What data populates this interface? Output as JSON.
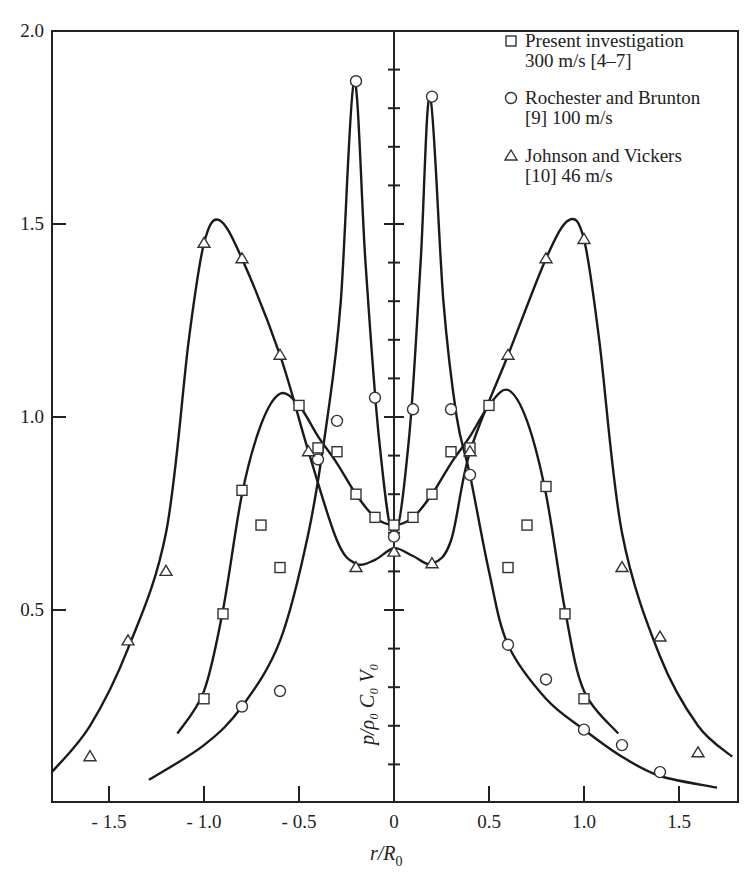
{
  "chart_data": {
    "type": "scatter",
    "title": "",
    "xlabel": "r/R0",
    "ylabel": "p/ρ0 C0 V0",
    "xlim": [
      -1.8,
      1.8
    ],
    "ylim": [
      0,
      2.0
    ],
    "grid": false,
    "legend_position": "upper right",
    "x_ticks": [
      -1.5,
      -1.0,
      -0.5,
      0,
      0.5,
      1.0,
      1.5
    ],
    "x_tick_labels": [
      "- 1.5",
      "- 1.0",
      "- 0.5",
      "0",
      "0.5",
      "1.0",
      "1.5"
    ],
    "y_ticks": [
      0.5,
      1.0,
      1.5,
      2.0
    ],
    "y_tick_labels": [
      "0.5",
      "1.0",
      "1.5",
      "2.0"
    ],
    "series": [
      {
        "name": "Present investigation 300 m/s [4-7]",
        "marker": "square",
        "points": [
          [
            -1.0,
            0.27
          ],
          [
            -0.9,
            0.49
          ],
          [
            -0.8,
            0.81
          ],
          [
            -0.7,
            0.72
          ],
          [
            -0.6,
            0.61
          ],
          [
            -0.5,
            1.03
          ],
          [
            -0.4,
            0.92
          ],
          [
            -0.3,
            0.91
          ],
          [
            -0.2,
            0.8
          ],
          [
            -0.1,
            0.74
          ],
          [
            0.0,
            0.72
          ],
          [
            0.1,
            0.74
          ],
          [
            0.2,
            0.8
          ],
          [
            0.3,
            0.91
          ],
          [
            0.4,
            0.92
          ],
          [
            0.5,
            1.03
          ],
          [
            0.6,
            0.61
          ],
          [
            0.7,
            0.72
          ],
          [
            0.8,
            0.82
          ],
          [
            0.9,
            0.49
          ],
          [
            1.0,
            0.27
          ]
        ],
        "curves": [
          [
            [
              -1.14,
              0.18
            ],
            [
              -1.0,
              0.29
            ],
            [
              -0.9,
              0.5
            ],
            [
              -0.8,
              0.8
            ],
            [
              -0.7,
              0.98
            ],
            [
              -0.6,
              1.06
            ],
            [
              -0.5,
              1.03
            ],
            [
              -0.4,
              0.95
            ],
            [
              -0.3,
              0.88
            ],
            [
              -0.2,
              0.8
            ],
            [
              -0.1,
              0.74
            ],
            [
              0.0,
              0.72
            ],
            [
              0.1,
              0.74
            ],
            [
              0.2,
              0.8
            ],
            [
              0.3,
              0.88
            ],
            [
              0.4,
              0.95
            ],
            [
              0.5,
              1.03
            ],
            [
              0.6,
              1.07
            ],
            [
              0.7,
              0.99
            ],
            [
              0.8,
              0.8
            ],
            [
              0.9,
              0.5
            ],
            [
              1.0,
              0.29
            ],
            [
              1.18,
              0.18
            ]
          ]
        ]
      },
      {
        "name": "Rochester and Brunton [9] 100 m/s",
        "marker": "circle",
        "points": [
          [
            -0.8,
            0.25
          ],
          [
            -0.6,
            0.29
          ],
          [
            -0.4,
            0.89
          ],
          [
            -0.3,
            0.99
          ],
          [
            -0.2,
            1.87
          ],
          [
            -0.1,
            1.05
          ],
          [
            0.0,
            0.69
          ],
          [
            0.1,
            1.02
          ],
          [
            0.2,
            1.83
          ],
          [
            0.3,
            1.02
          ],
          [
            0.4,
            0.85
          ],
          [
            0.6,
            0.41
          ],
          [
            0.8,
            0.32
          ],
          [
            1.0,
            0.19
          ],
          [
            1.2,
            0.15
          ],
          [
            1.4,
            0.08
          ]
        ],
        "curves": [
          [
            [
              -1.29,
              0.06
            ],
            [
              -1.0,
              0.15
            ],
            [
              -0.8,
              0.25
            ],
            [
              -0.6,
              0.42
            ],
            [
              -0.45,
              0.7
            ],
            [
              -0.35,
              1.0
            ],
            [
              -0.28,
              1.3
            ],
            [
              -0.21,
              1.87
            ],
            [
              -0.15,
              1.4
            ],
            [
              -0.08,
              0.95
            ],
            [
              0.0,
              0.69
            ],
            [
              0.08,
              0.95
            ],
            [
              0.14,
              1.4
            ],
            [
              0.19,
              1.83
            ],
            [
              0.26,
              1.3
            ],
            [
              0.33,
              1.0
            ],
            [
              0.4,
              0.85
            ],
            [
              0.5,
              0.6
            ],
            [
              0.6,
              0.41
            ],
            [
              0.8,
              0.27
            ],
            [
              1.0,
              0.19
            ],
            [
              1.2,
              0.12
            ],
            [
              1.4,
              0.07
            ],
            [
              1.7,
              0.04
            ]
          ]
        ]
      },
      {
        "name": "Johnson and Vickers [10] 46 m/s",
        "marker": "triangle",
        "points": [
          [
            -1.6,
            0.12
          ],
          [
            -1.4,
            0.42
          ],
          [
            -1.2,
            0.6
          ],
          [
            -1.0,
            1.45
          ],
          [
            -0.8,
            1.41
          ],
          [
            -0.6,
            1.16
          ],
          [
            -0.45,
            0.91
          ],
          [
            -0.2,
            0.61
          ],
          [
            0.0,
            0.65
          ],
          [
            0.2,
            0.62
          ],
          [
            0.4,
            0.91
          ],
          [
            0.6,
            1.16
          ],
          [
            0.8,
            1.41
          ],
          [
            1.0,
            1.46
          ],
          [
            1.2,
            0.61
          ],
          [
            1.4,
            0.43
          ],
          [
            1.6,
            0.13
          ]
        ],
        "curves": [
          [
            [
              -1.8,
              0.08
            ],
            [
              -1.6,
              0.2
            ],
            [
              -1.4,
              0.4
            ],
            [
              -1.2,
              0.7
            ],
            [
              -1.08,
              1.2
            ],
            [
              -1.0,
              1.45
            ],
            [
              -0.92,
              1.51
            ],
            [
              -0.8,
              1.41
            ],
            [
              -0.6,
              1.16
            ],
            [
              -0.45,
              0.91
            ],
            [
              -0.3,
              0.68
            ],
            [
              -0.2,
              0.62
            ],
            [
              -0.1,
              0.63
            ],
            [
              0.0,
              0.66
            ],
            [
              0.1,
              0.64
            ],
            [
              0.2,
              0.62
            ],
            [
              0.3,
              0.68
            ],
            [
              0.4,
              0.91
            ],
            [
              0.6,
              1.16
            ],
            [
              0.8,
              1.41
            ],
            [
              0.92,
              1.51
            ],
            [
              1.0,
              1.46
            ],
            [
              1.08,
              1.2
            ],
            [
              1.2,
              0.7
            ],
            [
              1.4,
              0.38
            ],
            [
              1.6,
              0.2
            ],
            [
              1.78,
              0.12
            ]
          ]
        ]
      }
    ],
    "legend": [
      {
        "marker": "square",
        "line1": "Present investigation",
        "line2": "300 m/s [4–7]"
      },
      {
        "marker": "circle",
        "line1": "Rochester and Brunton",
        "line2": "[9] 100 m/s"
      },
      {
        "marker": "triangle",
        "line1": "Johnson and Vickers",
        "line2": "[10] 46 m/s"
      }
    ]
  },
  "labels": {
    "xlabel_main": "r/R",
    "xlabel_sub": "0",
    "ylabel": "p/ρ₀ C₀ V₀"
  }
}
